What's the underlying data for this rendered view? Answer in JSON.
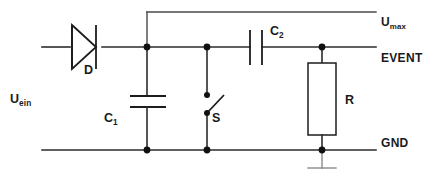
{
  "diagram": {
    "background_color": "#ffffff",
    "line_color": "#2b2b2b",
    "width": 431,
    "height": 180
  },
  "labels": {
    "input_voltage": "U",
    "input_voltage_sub": "ein",
    "diode": "D",
    "capacitor1": "C",
    "capacitor1_sub": "1",
    "switch": "S",
    "capacitor2": "C",
    "capacitor2_sub": "2",
    "resistor": "R",
    "rail_umax": "U",
    "rail_umax_sub": "max",
    "rail_event": "EVENT",
    "rail_gnd": "GND"
  },
  "components": [
    {
      "id": "D",
      "type": "diode",
      "label": "D",
      "orientation": "horizontal",
      "anode_side": "left"
    },
    {
      "id": "C1",
      "type": "capacitor",
      "label": "C1",
      "orientation": "vertical",
      "plates": "horizontal"
    },
    {
      "id": "S",
      "type": "switch",
      "label": "S",
      "orientation": "vertical",
      "state": "open"
    },
    {
      "id": "C2",
      "type": "capacitor",
      "label": "C2",
      "orientation": "horizontal",
      "plates": "vertical"
    },
    {
      "id": "R",
      "type": "resistor",
      "label": "R",
      "orientation": "vertical"
    }
  ],
  "rails": [
    {
      "id": "umax",
      "label": "Umax",
      "y": 12
    },
    {
      "id": "event",
      "label": "EVENT",
      "y": 47
    },
    {
      "id": "gnd",
      "label": "GND",
      "y": 150
    }
  ],
  "nodes": [
    {
      "x": 147,
      "y": 47
    },
    {
      "x": 207,
      "y": 47
    },
    {
      "x": 322,
      "y": 47
    },
    {
      "x": 147,
      "y": 150
    },
    {
      "x": 207,
      "y": 150
    },
    {
      "x": 322,
      "y": 150
    },
    {
      "x": 207,
      "y": 95
    },
    {
      "x": 207,
      "y": 113
    }
  ]
}
